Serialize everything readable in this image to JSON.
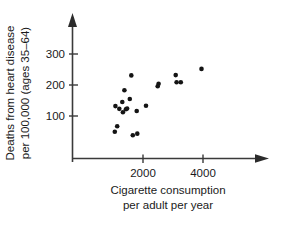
{
  "chart_data": {
    "type": "scatter",
    "title": "",
    "xlabel": "Cigarette consumption per adult per year",
    "xlabel_line1": "Cigarette consumption",
    "xlabel_line2": "per adult per year",
    "ylabel": "Deaths from heart disease per 100,000 (ages 35–64)",
    "ylabel_line1": "Deaths from heart disease",
    "ylabel_line2": "per 100,000 (ages 35–64)",
    "xticks": [
      2000,
      4000
    ],
    "xtick_labels": [
      "2000",
      "4000"
    ],
    "yticks": [
      100,
      200,
      300
    ],
    "ytick_labels": [
      "100",
      "200",
      "300"
    ],
    "xlim": [
      600,
      4800
    ],
    "ylim": [
      0,
      360
    ],
    "grid": false,
    "legend": null,
    "marker": "filled-circle",
    "marker_color": "#141414",
    "axis_color": "#3a3a3a",
    "background_color": "#ffffff",
    "points": [
      {
        "x": 1080,
        "y": 132
      },
      {
        "x": 1210,
        "y": 123
      },
      {
        "x": 1310,
        "y": 145
      },
      {
        "x": 1330,
        "y": 112
      },
      {
        "x": 1430,
        "y": 122
      },
      {
        "x": 1470,
        "y": 124
      },
      {
        "x": 1380,
        "y": 183
      },
      {
        "x": 1560,
        "y": 155
      },
      {
        "x": 1610,
        "y": 231
      },
      {
        "x": 1790,
        "y": 116
      },
      {
        "x": 2100,
        "y": 133
      },
      {
        "x": 2490,
        "y": 196
      },
      {
        "x": 2520,
        "y": 204
      },
      {
        "x": 3090,
        "y": 232
      },
      {
        "x": 3120,
        "y": 209
      },
      {
        "x": 3260,
        "y": 209
      },
      {
        "x": 3950,
        "y": 252
      },
      {
        "x": 1140,
        "y": 67
      },
      {
        "x": 1060,
        "y": 49
      },
      {
        "x": 1660,
        "y": 38
      },
      {
        "x": 1810,
        "y": 43
      }
    ]
  },
  "figure": {
    "caption": "",
    "source_note": ""
  },
  "icons": {
    "x_axis_arrow": "arrow-right-icon",
    "y_axis_arrow": "arrow-up-icon"
  }
}
